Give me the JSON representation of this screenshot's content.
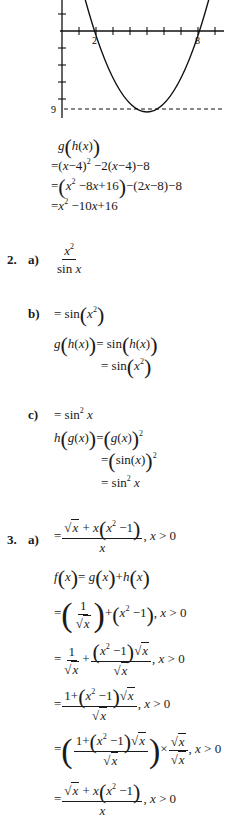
{
  "graph": {
    "x_labels": {
      "left_root": "2",
      "right_root": "8"
    },
    "y_label_min": "9",
    "axis": {
      "y_axis_x_px": 62,
      "x_axis_y_px": 31,
      "unit_px": 17
    },
    "parabola": {
      "roots": [
        2,
        8
      ],
      "vertex": [
        5,
        -9
      ]
    }
  },
  "problem1_tail": {
    "lines": [
      "g(h(x))",
      "=(x−4)² −2(x−4)−8",
      "=(x² −8x+16)−(2x−8)−8",
      "=x² −10x+16"
    ]
  },
  "problem2": {
    "number": "2.",
    "a": {
      "label": "a)",
      "numerator": "x²",
      "denominator": "sin x"
    },
    "b": {
      "label": "b)",
      "answer": "= sin(x²)",
      "work": [
        "g(h(x)) = sin(h(x))",
        "= sin(x²)"
      ]
    },
    "c": {
      "label": "c)",
      "answer": "= sin² x",
      "work": [
        "h(g(x)) = (g(x))²",
        "= (sin(x))²",
        "= sin² x"
      ]
    }
  },
  "problem3": {
    "number": "3.",
    "a": {
      "label": "a)",
      "answer": "= (√x + x(x² −1)) / x, x > 0",
      "condition": ", x > 0",
      "work": [
        "f(x) = g(x) + h(x)",
        "= (1/√x) + (x² −1), x > 0",
        "= 1/√x + (x² −1)√x / √x, x > 0",
        "= (1+(x² −1)√x) / √x, x > 0",
        "= ((1+(x² −1)√x) / √x) × √x/√x, x > 0",
        "= (√x + x(x² −1)) / x, x > 0"
      ]
    }
  }
}
